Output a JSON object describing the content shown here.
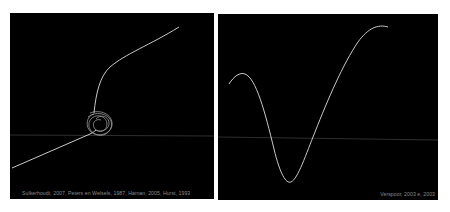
{
  "colors": {
    "background": "#ffffff",
    "panel": "#000000",
    "curve": "#c8c8c8",
    "baseline": "#3a3a3a",
    "caption": "#8a8a8a"
  },
  "panels": [
    {
      "id": "left",
      "description": "Trajectory with a tangled attractor loop between two linear segments",
      "caption": "Sulkerhoudt, 2007, Peters en Welsels, 1987, Haman, 2005, Hurst, 1993"
    },
    {
      "id": "right",
      "description": "Smooth curve dipping down to a minimum then rising to a high plateau",
      "caption": "Verspoor, 2003 e, 2003"
    }
  ]
}
